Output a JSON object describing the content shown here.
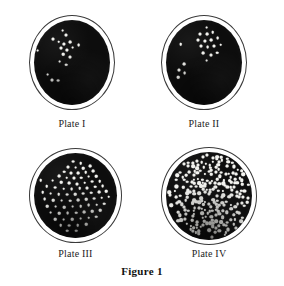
{
  "figure": {
    "caption": "Figure 1",
    "background_color": "#ffffff",
    "agar_color": "#0d0d0d",
    "rim_color": "#3a3a3a",
    "colony_color": "#f2f2ee",
    "canvas": {
      "width": 284,
      "height": 286
    }
  },
  "plates": [
    {
      "id": "plate-1",
      "label": "Plate I",
      "colony_count": 18,
      "density": "very low",
      "rim_box": {
        "x": 29,
        "y": 15,
        "w": 86,
        "h": 95
      },
      "agar_box": {
        "x": 34,
        "y": 20,
        "w": 76,
        "h": 85
      },
      "label_box": {
        "x": 29,
        "y": 118,
        "w": 86,
        "h": 12
      },
      "colonies": [
        {
          "x": 53.0,
          "y": 38.5,
          "r": 1.5
        },
        {
          "x": 62.5,
          "y": 30.5,
          "r": 1.4
        },
        {
          "x": 66.0,
          "y": 35.0,
          "r": 1.5
        },
        {
          "x": 58.5,
          "y": 41.5,
          "r": 1.3
        },
        {
          "x": 64.0,
          "y": 44.0,
          "r": 1.6
        },
        {
          "x": 70.0,
          "y": 42.0,
          "r": 1.4
        },
        {
          "x": 60.5,
          "y": 47.5,
          "r": 1.5
        },
        {
          "x": 66.5,
          "y": 49.5,
          "r": 1.6
        },
        {
          "x": 72.5,
          "y": 47.5,
          "r": 1.4
        },
        {
          "x": 78.5,
          "y": 45.0,
          "r": 1.4
        },
        {
          "x": 63.0,
          "y": 54.0,
          "r": 1.3
        },
        {
          "x": 69.5,
          "y": 56.5,
          "r": 1.5
        },
        {
          "x": 59.5,
          "y": 61.5,
          "r": 1.4
        },
        {
          "x": 66.0,
          "y": 64.5,
          "r": 1.3
        },
        {
          "x": 37.5,
          "y": 50.5,
          "r": 1.4
        },
        {
          "x": 47.5,
          "y": 74.5,
          "r": 1.4
        },
        {
          "x": 51.5,
          "y": 79.5,
          "r": 1.5
        },
        {
          "x": 58.0,
          "y": 80.5,
          "r": 1.4
        }
      ]
    },
    {
      "id": "plate-2",
      "label": "Plate II",
      "colony_count": 21,
      "density": "low",
      "rim_box": {
        "x": 161,
        "y": 15,
        "w": 86,
        "h": 95
      },
      "agar_box": {
        "x": 166,
        "y": 20,
        "w": 76,
        "h": 85
      },
      "label_box": {
        "x": 161,
        "y": 118,
        "w": 86,
        "h": 12
      },
      "colonies": [
        {
          "x": 206.5,
          "y": 27.5,
          "r": 1.4
        },
        {
          "x": 200.0,
          "y": 33.5,
          "r": 1.5
        },
        {
          "x": 207.0,
          "y": 34.0,
          "r": 1.4
        },
        {
          "x": 212.5,
          "y": 32.0,
          "r": 1.3
        },
        {
          "x": 197.5,
          "y": 39.5,
          "r": 1.5
        },
        {
          "x": 204.5,
          "y": 40.5,
          "r": 1.6
        },
        {
          "x": 211.0,
          "y": 40.0,
          "r": 1.4
        },
        {
          "x": 217.5,
          "y": 38.0,
          "r": 1.4
        },
        {
          "x": 200.5,
          "y": 46.0,
          "r": 1.5
        },
        {
          "x": 207.5,
          "y": 47.0,
          "r": 1.4
        },
        {
          "x": 214.0,
          "y": 46.0,
          "r": 1.5
        },
        {
          "x": 220.5,
          "y": 44.5,
          "r": 1.3
        },
        {
          "x": 203.0,
          "y": 53.0,
          "r": 1.4
        },
        {
          "x": 210.5,
          "y": 54.5,
          "r": 1.5
        },
        {
          "x": 217.0,
          "y": 52.5,
          "r": 1.3
        },
        {
          "x": 206.5,
          "y": 60.5,
          "r": 1.4
        },
        {
          "x": 180.5,
          "y": 44.0,
          "r": 1.3
        },
        {
          "x": 184.0,
          "y": 64.0,
          "r": 1.4
        },
        {
          "x": 178.5,
          "y": 69.5,
          "r": 1.5
        },
        {
          "x": 184.5,
          "y": 73.0,
          "r": 1.4
        },
        {
          "x": 178.0,
          "y": 77.0,
          "r": 1.3
        }
      ]
    },
    {
      "id": "plate-3",
      "label": "Plate III",
      "colony_count": 78,
      "density": "moderate",
      "rim_box": {
        "x": 29,
        "y": 148,
        "w": 93,
        "h": 95
      },
      "agar_box": {
        "x": 34,
        "y": 153,
        "w": 83,
        "h": 85
      },
      "label_box": {
        "x": 29,
        "y": 248,
        "w": 93,
        "h": 12
      },
      "colonies": [
        {
          "x": 73.0,
          "y": 161.5,
          "r": 1.4
        },
        {
          "x": 80.5,
          "y": 163.0,
          "r": 1.3
        },
        {
          "x": 68.0,
          "y": 166.5,
          "r": 1.5
        },
        {
          "x": 75.5,
          "y": 167.5,
          "r": 1.4
        },
        {
          "x": 83.0,
          "y": 168.0,
          "r": 1.3
        },
        {
          "x": 90.0,
          "y": 166.0,
          "r": 1.4
        },
        {
          "x": 64.0,
          "y": 171.5,
          "r": 1.3
        },
        {
          "x": 71.0,
          "y": 172.5,
          "r": 1.5
        },
        {
          "x": 78.0,
          "y": 173.0,
          "r": 1.4
        },
        {
          "x": 85.5,
          "y": 172.0,
          "r": 1.3
        },
        {
          "x": 93.0,
          "y": 171.0,
          "r": 1.4
        },
        {
          "x": 59.0,
          "y": 176.0,
          "r": 1.4
        },
        {
          "x": 66.5,
          "y": 177.5,
          "r": 1.3
        },
        {
          "x": 74.0,
          "y": 178.0,
          "r": 1.5
        },
        {
          "x": 81.0,
          "y": 177.5,
          "r": 1.3
        },
        {
          "x": 88.5,
          "y": 176.5,
          "r": 1.4
        },
        {
          "x": 96.0,
          "y": 176.0,
          "r": 1.3
        },
        {
          "x": 52.5,
          "y": 180.5,
          "r": 1.4
        },
        {
          "x": 61.0,
          "y": 182.0,
          "r": 1.3
        },
        {
          "x": 69.0,
          "y": 183.0,
          "r": 1.4
        },
        {
          "x": 77.0,
          "y": 183.5,
          "r": 1.5
        },
        {
          "x": 84.5,
          "y": 182.5,
          "r": 1.3
        },
        {
          "x": 92.0,
          "y": 181.5,
          "r": 1.4
        },
        {
          "x": 99.5,
          "y": 181.0,
          "r": 1.3
        },
        {
          "x": 46.5,
          "y": 186.0,
          "r": 1.3
        },
        {
          "x": 55.0,
          "y": 187.5,
          "r": 1.4
        },
        {
          "x": 63.5,
          "y": 188.5,
          "r": 1.3
        },
        {
          "x": 71.5,
          "y": 189.0,
          "r": 1.4
        },
        {
          "x": 79.5,
          "y": 188.0,
          "r": 1.3
        },
        {
          "x": 87.0,
          "y": 187.5,
          "r": 1.5
        },
        {
          "x": 95.0,
          "y": 186.5,
          "r": 1.3
        },
        {
          "x": 102.5,
          "y": 186.0,
          "r": 1.4
        },
        {
          "x": 42.5,
          "y": 192.0,
          "r": 1.3
        },
        {
          "x": 50.5,
          "y": 193.5,
          "r": 1.4
        },
        {
          "x": 58.5,
          "y": 194.0,
          "r": 1.3
        },
        {
          "x": 67.0,
          "y": 194.5,
          "r": 1.4
        },
        {
          "x": 75.0,
          "y": 194.0,
          "r": 1.3
        },
        {
          "x": 83.0,
          "y": 193.5,
          "r": 1.4
        },
        {
          "x": 91.0,
          "y": 192.5,
          "r": 1.3
        },
        {
          "x": 99.0,
          "y": 192.0,
          "r": 1.4
        },
        {
          "x": 106.0,
          "y": 191.0,
          "r": 1.3
        },
        {
          "x": 44.5,
          "y": 199.0,
          "r": 1.4
        },
        {
          "x": 53.0,
          "y": 200.0,
          "r": 1.3
        },
        {
          "x": 61.5,
          "y": 200.5,
          "r": 1.4
        },
        {
          "x": 70.0,
          "y": 200.5,
          "r": 1.3
        },
        {
          "x": 78.0,
          "y": 200.0,
          "r": 1.4
        },
        {
          "x": 86.0,
          "y": 199.0,
          "r": 1.3
        },
        {
          "x": 94.0,
          "y": 198.5,
          "r": 1.4
        },
        {
          "x": 101.5,
          "y": 197.5,
          "r": 1.3
        },
        {
          "x": 47.0,
          "y": 206.0,
          "r": 1.3
        },
        {
          "x": 55.5,
          "y": 206.5,
          "r": 1.4
        },
        {
          "x": 64.0,
          "y": 207.0,
          "r": 1.3
        },
        {
          "x": 72.5,
          "y": 206.5,
          "r": 1.4
        },
        {
          "x": 80.5,
          "y": 206.0,
          "r": 1.3
        },
        {
          "x": 88.5,
          "y": 205.0,
          "r": 1.4
        },
        {
          "x": 96.5,
          "y": 204.5,
          "r": 1.3
        },
        {
          "x": 104.0,
          "y": 203.5,
          "r": 1.3
        },
        {
          "x": 50.5,
          "y": 212.5,
          "r": 1.4
        },
        {
          "x": 59.0,
          "y": 213.0,
          "r": 1.3
        },
        {
          "x": 67.5,
          "y": 213.0,
          "r": 1.4
        },
        {
          "x": 76.0,
          "y": 212.5,
          "r": 1.3
        },
        {
          "x": 84.0,
          "y": 212.0,
          "r": 1.4
        },
        {
          "x": 92.0,
          "y": 211.0,
          "r": 1.3
        },
        {
          "x": 100.0,
          "y": 210.0,
          "r": 1.3
        },
        {
          "x": 55.0,
          "y": 219.0,
          "r": 1.3
        },
        {
          "x": 63.5,
          "y": 219.5,
          "r": 1.4
        },
        {
          "x": 72.0,
          "y": 219.0,
          "r": 1.3
        },
        {
          "x": 80.5,
          "y": 218.5,
          "r": 1.4
        },
        {
          "x": 88.5,
          "y": 217.5,
          "r": 1.3
        },
        {
          "x": 96.0,
          "y": 216.5,
          "r": 1.3
        },
        {
          "x": 60.5,
          "y": 225.0,
          "r": 1.3
        },
        {
          "x": 69.0,
          "y": 225.5,
          "r": 1.4
        },
        {
          "x": 77.5,
          "y": 225.0,
          "r": 1.3
        },
        {
          "x": 86.0,
          "y": 224.0,
          "r": 1.3
        },
        {
          "x": 67.0,
          "y": 230.5,
          "r": 1.3
        },
        {
          "x": 76.0,
          "y": 230.5,
          "r": 1.3
        },
        {
          "x": 40.5,
          "y": 180.0,
          "r": 1.3
        },
        {
          "x": 108.5,
          "y": 196.5,
          "r": 1.3
        }
      ]
    },
    {
      "id": "plate-4",
      "label": "Plate IV",
      "colony_count": 232,
      "density": "high",
      "rim_box": {
        "x": 161,
        "y": 147,
        "w": 96,
        "h": 98
      },
      "agar_box": {
        "x": 166,
        "y": 152,
        "w": 86,
        "h": 88
      },
      "label_box": {
        "x": 161,
        "y": 248,
        "w": 96,
        "h": 12
      },
      "colonies_generated": {
        "center_x": 209,
        "center_y": 196,
        "radius_x": 41,
        "radius_y": 42,
        "count": 232,
        "min_r": 1.1,
        "max_r": 1.9,
        "seed": 20240617,
        "core_bias": 0.62
      }
    }
  ]
}
